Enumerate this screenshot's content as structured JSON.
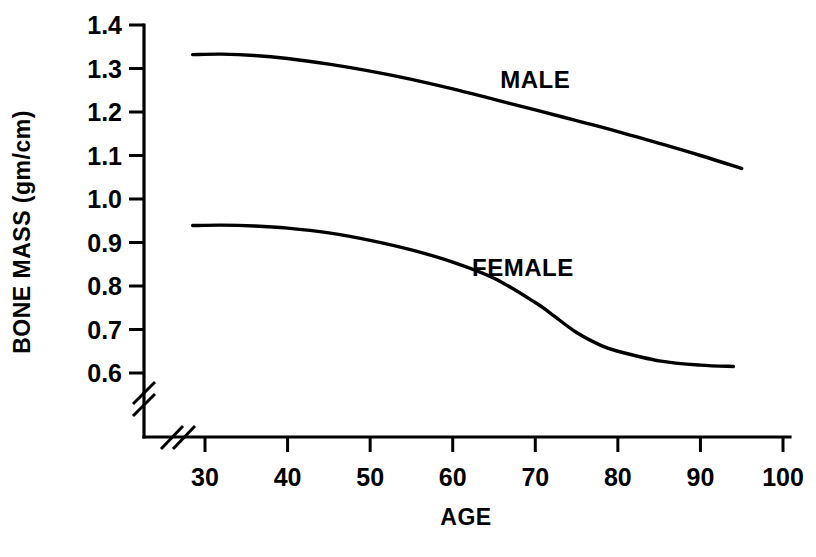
{
  "chart_data": {
    "type": "line",
    "title": "",
    "xlabel": "AGE",
    "ylabel": "BONE MASS (gm/cm)",
    "xlim": [
      24,
      100
    ],
    "ylim": [
      0.55,
      1.45
    ],
    "xticks": [
      30,
      40,
      50,
      60,
      70,
      80,
      90,
      100
    ],
    "xtick_labels": [
      "30",
      "40",
      "50",
      "60",
      "70",
      "80",
      "90",
      "100"
    ],
    "yticks": [
      0.6,
      0.7,
      0.8,
      0.9,
      1.0,
      1.1,
      1.2,
      1.3,
      1.4
    ],
    "ytick_labels": [
      "0.6",
      "0.7",
      "0.8",
      "0.9",
      "1.0",
      "1.1",
      "1.2",
      "1.3",
      "1.4"
    ],
    "grid": false,
    "legend_position": "inline-annotation",
    "axis_break_x": true,
    "axis_break_y": true,
    "series": [
      {
        "name": "MALE",
        "label_x": 70,
        "label_y": 1.255,
        "x": [
          28.5,
          32,
          36,
          40,
          45,
          50,
          55,
          60,
          65,
          70,
          75,
          80,
          85,
          90,
          95
        ],
        "values": [
          1.332,
          1.333,
          1.33,
          1.323,
          1.31,
          1.294,
          1.275,
          1.253,
          1.229,
          1.205,
          1.18,
          1.155,
          1.128,
          1.1,
          1.07
        ]
      },
      {
        "name": "FEMALE",
        "label_x": 68.5,
        "label_y": 0.822,
        "x": [
          28.5,
          32,
          36,
          40,
          45,
          50,
          55,
          60,
          65,
          70,
          72,
          75,
          78,
          80,
          85,
          90,
          94
        ],
        "values": [
          0.939,
          0.94,
          0.938,
          0.933,
          0.922,
          0.905,
          0.883,
          0.855,
          0.818,
          0.762,
          0.735,
          0.693,
          0.663,
          0.65,
          0.628,
          0.618,
          0.615
        ]
      }
    ]
  }
}
